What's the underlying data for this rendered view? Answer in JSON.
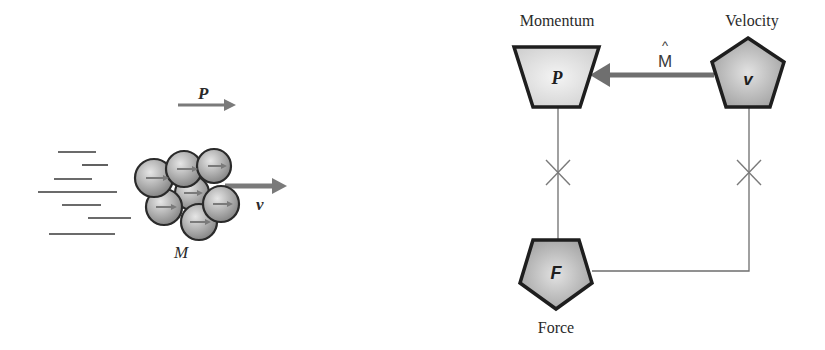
{
  "left_panel": {
    "momentum_symbol": "P",
    "velocity_symbol": "v",
    "mass_symbol": "M"
  },
  "right_panel": {
    "momentum_label": "Momentum",
    "velocity_label": "Velocity",
    "force_label": "Force",
    "momentum_node_symbol": "P",
    "velocity_node_symbol": "v",
    "force_node_symbol": "F",
    "arrow_label": "M̂",
    "arrow_label_base": "M",
    "arrow_label_hat": "^"
  },
  "colors": {
    "stroke_dark": "#1e1e1e",
    "arrow_gray": "#7a7a7a",
    "line_gray": "#6e6e6e",
    "node_light_fill": "#e4e4e4",
    "node_mid_fill": "#b8b8b8"
  }
}
